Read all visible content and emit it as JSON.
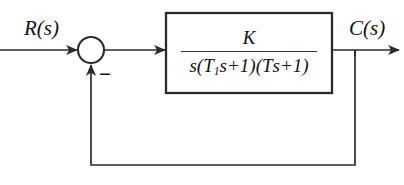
{
  "diagram": {
    "type": "control-system-block-diagram",
    "background_color": "#ffffff",
    "line_color": "#2b2b2b",
    "text_color": "#111111"
  },
  "labels": {
    "input_signal": "R(s)",
    "output_signal": "C(s)",
    "feedback_sign": "−"
  },
  "summing_junction": {
    "name": "summing-junction",
    "shape": "circle",
    "center_x": 91,
    "center_y": 50,
    "radius": 13,
    "inputs": [
      "R(s)",
      "feedback"
    ],
    "signs": [
      "+",
      "-"
    ]
  },
  "block": {
    "name": "transfer-function-block",
    "x": 166,
    "y": 13,
    "width": 166,
    "height": 80,
    "transfer_function": {
      "numerator": "K",
      "denominator_parts": [
        {
          "text": "s("
        },
        {
          "text": "T",
          "sub": "1"
        },
        {
          "text": "s+1)("
        },
        {
          "text": "T",
          "sub": "2"
        },
        {
          "text": "s+1)"
        }
      ],
      "denominator_plain": "s(T1s+1)(T2s+1)",
      "full": "K / [s(T1s+1)(T2s+1)]"
    }
  },
  "connections": {
    "input_line": {
      "from_x": 0,
      "to_x": 78,
      "y": 50,
      "arrow": true
    },
    "error_line": {
      "from_x": 104,
      "to_x": 166,
      "y": 50,
      "arrow": true
    },
    "output_line": {
      "from_x": 332,
      "to_x": 400,
      "y": 50,
      "arrow": true
    },
    "feedback_tap": {
      "x": 355,
      "y": 50
    },
    "feedback_down": {
      "x": 355,
      "from_y": 50,
      "to_y": 165
    },
    "feedback_across": {
      "y": 165,
      "from_x": 355,
      "to_x": 91
    },
    "feedback_up": {
      "x": 91,
      "from_y": 165,
      "to_y": 64,
      "arrow": true
    }
  }
}
